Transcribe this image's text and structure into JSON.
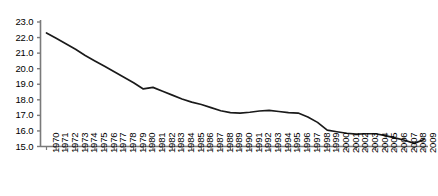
{
  "chart_data": {
    "type": "line",
    "title": "",
    "subtitle": "",
    "xlabel": "",
    "ylabel": "",
    "grid": false,
    "legend": "none",
    "xlim": [
      1970,
      2009
    ],
    "ylim": [
      15.0,
      23.0
    ],
    "ytick_labels": [
      "23.0",
      "22.0",
      "21.0",
      "20.0",
      "19.0",
      "18.0",
      "17.0",
      "16.0",
      "15.0"
    ],
    "ytick_values": [
      23.0,
      22.0,
      21.0,
      20.0,
      19.0,
      18.0,
      17.0,
      16.0,
      15.0
    ],
    "categories": [
      "1970",
      "1971",
      "1972",
      "1973",
      "1974",
      "1975",
      "1976",
      "1977",
      "1978",
      "1979",
      "1980",
      "1981",
      "1982",
      "1983",
      "1984",
      "1985",
      "1986",
      "1987",
      "1988",
      "1989",
      "1990",
      "1991",
      "1992",
      "1993",
      "1994",
      "1995",
      "1996",
      "1997",
      "1998",
      "1999",
      "2000",
      "2001",
      "2002",
      "2003",
      "2004",
      "2005",
      "2006",
      "2007",
      "2008",
      "2009"
    ],
    "values": [
      22.3,
      21.95,
      21.6,
      21.25,
      20.85,
      20.5,
      20.15,
      19.8,
      19.45,
      19.1,
      18.7,
      18.8,
      18.55,
      18.3,
      18.05,
      17.85,
      17.7,
      17.5,
      17.3,
      17.18,
      17.15,
      17.2,
      17.28,
      17.32,
      17.25,
      17.18,
      17.15,
      16.9,
      16.55,
      16.05,
      15.95,
      15.85,
      15.8,
      15.82,
      15.82,
      15.7,
      15.55,
      15.4,
      15.2,
      15.45
    ],
    "series_color": "#1a1a1a",
    "axis_color": "#7a7a7a"
  }
}
